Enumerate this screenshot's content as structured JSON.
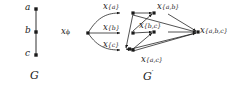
{
  "figure": {
    "type": "graph-diagram",
    "ink_color": "#1a1a1a",
    "background": "#ffffff",
    "left_graph": {
      "name": "G",
      "caption": "G",
      "vertices": [
        {
          "id": "a",
          "label": "a",
          "x": 36,
          "y": 9
        },
        {
          "id": "b",
          "label": "b",
          "x": 36,
          "y": 32
        },
        {
          "id": "c",
          "label": "c",
          "x": 36,
          "y": 55
        }
      ],
      "edges": [
        {
          "from": "a",
          "to": "b"
        },
        {
          "from": "b",
          "to": "c"
        }
      ]
    },
    "right_graph": {
      "name": "G'",
      "caption": "G",
      "caption_prime": "′",
      "nodes": [
        {
          "id": "empty",
          "base": "x",
          "subscript": "ϕ",
          "label": "x_ϕ",
          "x": 80,
          "y": 33
        },
        {
          "id": "a",
          "base": "x",
          "subscript": "{a}",
          "label": "x_{a}",
          "x": 126,
          "y": 13
        },
        {
          "id": "b",
          "base": "x",
          "subscript": "{b}",
          "label": "x_{b}",
          "x": 126,
          "y": 33
        },
        {
          "id": "c",
          "base": "x",
          "subscript": "{c}",
          "label": "x_{c}",
          "x": 126,
          "y": 50
        },
        {
          "id": "ab",
          "base": "x",
          "subscript": "{a,b}",
          "label": "x_{a,b}",
          "x": 160,
          "y": 13
        },
        {
          "id": "bc",
          "base": "x",
          "subscript": "{b,c}",
          "label": "x_{b,c}",
          "x": 160,
          "y": 31
        },
        {
          "id": "ac",
          "base": "x",
          "subscript": "{a,c}",
          "label": "x_{a,c}",
          "x": 148,
          "y": 54
        },
        {
          "id": "abc",
          "base": "x",
          "subscript": "{a,b,c}",
          "label": "x_{a,b,c}",
          "x": 203,
          "y": 32
        }
      ],
      "edges": [
        {
          "from": "empty",
          "to": "a"
        },
        {
          "from": "empty",
          "to": "b"
        },
        {
          "from": "empty",
          "to": "c"
        },
        {
          "from": "a",
          "to": "ab"
        },
        {
          "from": "a",
          "to": "ac"
        },
        {
          "from": "b",
          "to": "ab"
        },
        {
          "from": "b",
          "to": "bc"
        },
        {
          "from": "c",
          "to": "bc"
        },
        {
          "from": "c",
          "to": "ac"
        },
        {
          "from": "ab",
          "to": "abc"
        },
        {
          "from": "bc",
          "to": "abc"
        },
        {
          "from": "ac",
          "to": "abc"
        }
      ]
    },
    "captions": {
      "left": "G",
      "right_base": "G",
      "right_prime": "′",
      "left_x": 33,
      "right_x": 145,
      "y": 76
    }
  }
}
